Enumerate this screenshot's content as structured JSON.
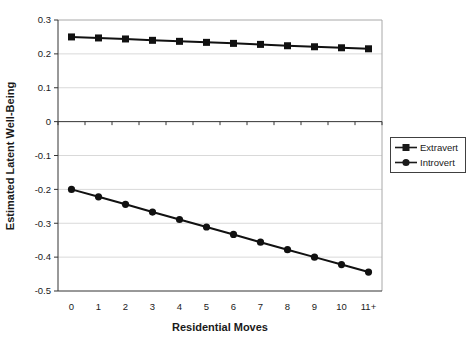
{
  "chart": {
    "y_axis_title": "Estimated Latent Well-Being",
    "x_axis_title": "Residential Moves"
  },
  "legend": {
    "items": [
      {
        "label": "Extravert",
        "marker": "square"
      },
      {
        "label": "Introvert",
        "marker": "circle"
      }
    ]
  },
  "chart_data": {
    "type": "line",
    "title": "",
    "xlabel": "Residential Moves",
    "ylabel": "Estimated Latent Well-Being",
    "categories": [
      "0",
      "1",
      "2",
      "3",
      "4",
      "5",
      "6",
      "7",
      "8",
      "9",
      "10",
      "11+"
    ],
    "series": [
      {
        "name": "Extravert",
        "marker": "square",
        "color": "#111111",
        "values": [
          0.25,
          0.247,
          0.244,
          0.24,
          0.237,
          0.234,
          0.231,
          0.228,
          0.224,
          0.221,
          0.218,
          0.215
        ]
      },
      {
        "name": "Introvert",
        "marker": "circle",
        "color": "#111111",
        "values": [
          -0.2,
          -0.222,
          -0.244,
          -0.267,
          -0.289,
          -0.311,
          -0.333,
          -0.356,
          -0.378,
          -0.4,
          -0.422,
          -0.444
        ]
      }
    ],
    "ylim": [
      -0.5,
      0.3
    ],
    "yticks": [
      "0.3",
      "0.2",
      "0.1",
      "0",
      "-0.1",
      "-0.2",
      "-0.3",
      "-0.4",
      "-0.5"
    ],
    "grid": "horizontal",
    "legend_position": "right",
    "styles": {
      "series_color": "#111111",
      "gridline_color": "#d9d9d9",
      "plot_border_color": "#a8a8a8",
      "axis_color": "#333333",
      "text_color": "#1a1a1a",
      "background": "#ffffff"
    }
  }
}
